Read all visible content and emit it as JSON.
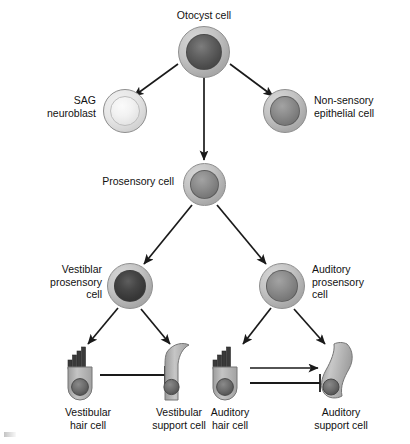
{
  "diagram": {
    "background_color": "#ffffff",
    "stroke_color": "#1a1a1a",
    "cell_ring_color": "#c3c3c3",
    "nucleus_dark_color": "#4c4c4c",
    "nucleus_mid_color": "#808080",
    "nucleus_light_color": "#efefef"
  },
  "nodes": {
    "otocyst": {
      "label": "Otocyst cell",
      "nucleus": "dark"
    },
    "sag_neuroblast": {
      "label": "SAG\nneuroblast",
      "nucleus": "light"
    },
    "non_sensory": {
      "label": "Non-sensory\nepithelial cell",
      "nucleus": "mid"
    },
    "prosensory": {
      "label": "Prosensory cell",
      "nucleus": "mid"
    },
    "vestibular_prosensory": {
      "label": "Vestiblar\nprosensory\ncell",
      "nucleus": "verydark"
    },
    "auditory_prosensory": {
      "label": "Auditory\nprosensory\ncell",
      "nucleus": "mid"
    },
    "vestibular_hair": {
      "label": "Vestibular\nhair cell",
      "shape": "hair-cell"
    },
    "vestibular_support": {
      "label": "Vestibular\nsupport cell",
      "shape": "vestibular-support-cell"
    },
    "auditory_hair": {
      "label": "Auditory\nhair cell",
      "shape": "hair-cell"
    },
    "auditory_support": {
      "label": "Auditory\nsupport cell",
      "shape": "auditory-support-cell"
    }
  },
  "edges": [
    {
      "from": "otocyst",
      "to": "sag_neuroblast",
      "type": "arrow"
    },
    {
      "from": "otocyst",
      "to": "prosensory",
      "type": "arrow"
    },
    {
      "from": "otocyst",
      "to": "non_sensory",
      "type": "arrow"
    },
    {
      "from": "prosensory",
      "to": "vestibular_prosensory",
      "type": "arrow"
    },
    {
      "from": "prosensory",
      "to": "auditory_prosensory",
      "type": "arrow"
    },
    {
      "from": "vestibular_prosensory",
      "to": "vestibular_hair",
      "type": "arrow"
    },
    {
      "from": "vestibular_prosensory",
      "to": "vestibular_support",
      "type": "arrow"
    },
    {
      "from": "auditory_prosensory",
      "to": "auditory_hair",
      "type": "arrow"
    },
    {
      "from": "auditory_prosensory",
      "to": "auditory_support",
      "type": "arrow"
    },
    {
      "from": "vestibular_hair",
      "to": "vestibular_support",
      "type": "inhibition"
    },
    {
      "from": "auditory_hair",
      "to": "auditory_support",
      "type": "arrow"
    },
    {
      "from": "auditory_hair",
      "to": "auditory_support",
      "type": "inhibition"
    }
  ]
}
